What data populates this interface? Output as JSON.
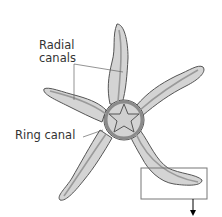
{
  "diagram": {
    "labels": {
      "radial_canals_line1": "Radial",
      "radial_canals_line2": "canals",
      "ring_canal": "Ring canal"
    },
    "colors": {
      "body_fill": "#d4d4d4",
      "outline": "#555555",
      "canal": "#9a9a9a",
      "box": "#777777"
    }
  }
}
